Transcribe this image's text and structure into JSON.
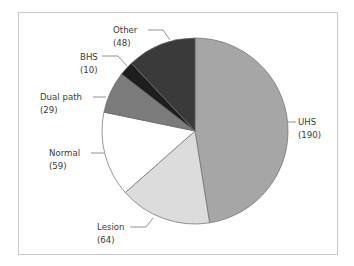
{
  "chart_data": {
    "type": "pie",
    "title": "",
    "total": 400,
    "start_angle_deg": 0,
    "direction": "clockwise",
    "slices": [
      {
        "label": "UHS",
        "value": 190,
        "value_text": "(190)",
        "color": "#a6a6a6"
      },
      {
        "label": "Lesion",
        "value": 64,
        "value_text": "(64)",
        "color": "#dcdcdc"
      },
      {
        "label": "Normal",
        "value": 59,
        "value_text": "(59)",
        "color": "#ffffff"
      },
      {
        "label": "Dual path",
        "value": 29,
        "value_text": "(29)",
        "color": "#7b7b7b"
      },
      {
        "label": "BHS",
        "value": 10,
        "value_text": "(10)",
        "color": "#1e1e1e"
      },
      {
        "label": "Other",
        "value": 48,
        "value_text": "(48)",
        "color": "#3a3a3a"
      }
    ],
    "legend": "none (leader-line labels)",
    "grid": false
  },
  "labels": {
    "uhs": {
      "name": "UHS",
      "value": "(190)"
    },
    "lesion": {
      "name": "Lesion",
      "value": "(64)"
    },
    "normal": {
      "name": "Normal",
      "value": "(59)"
    },
    "dual": {
      "name": "Dual path",
      "value": "(29)"
    },
    "bhs": {
      "name": "BHS",
      "value": "(10)"
    },
    "other": {
      "name": "Other",
      "value": "(48)"
    }
  }
}
